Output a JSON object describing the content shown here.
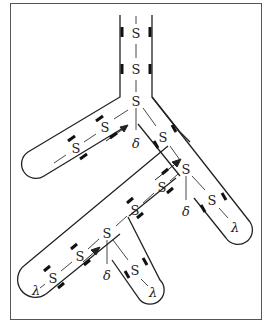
{
  "diagram": {
    "type": "branching tube diagram",
    "border_color": "#555555",
    "line_color": "#222222",
    "nodes": [
      {
        "id": "s1",
        "label": "S",
        "x": 136,
        "y": 33
      },
      {
        "id": "s2",
        "label": "S",
        "x": 136,
        "y": 69
      },
      {
        "id": "s3",
        "label": "S",
        "x": 136,
        "y": 101
      },
      {
        "id": "s4",
        "label": "S",
        "x": 105,
        "y": 127
      },
      {
        "id": "s5",
        "label": "S",
        "x": 76,
        "y": 148
      },
      {
        "id": "s6",
        "label": "S",
        "x": 163,
        "y": 137
      },
      {
        "id": "s7",
        "label": "S",
        "x": 186,
        "y": 169
      },
      {
        "id": "s8",
        "label": "S",
        "x": 162,
        "y": 187
      },
      {
        "id": "s9",
        "label": "S",
        "x": 135,
        "y": 210
      },
      {
        "id": "s10",
        "label": "S",
        "x": 107,
        "y": 233
      },
      {
        "id": "s11",
        "label": "S",
        "x": 80,
        "y": 256
      },
      {
        "id": "s12",
        "label": "S",
        "x": 53,
        "y": 278
      },
      {
        "id": "s13",
        "label": "S",
        "x": 212,
        "y": 200
      },
      {
        "id": "s14",
        "label": "S",
        "x": 135,
        "y": 270
      }
    ],
    "delta_labels": [
      {
        "label": "δ",
        "x": 136,
        "y": 144
      },
      {
        "label": "δ",
        "x": 186,
        "y": 212
      },
      {
        "label": "δ",
        "x": 107,
        "y": 276
      }
    ],
    "lambda_labels": [
      {
        "label": "λ",
        "x": 235,
        "y": 228
      },
      {
        "label": "λ",
        "x": 153,
        "y": 293
      },
      {
        "label": "λ",
        "x": 36,
        "y": 291
      }
    ]
  }
}
